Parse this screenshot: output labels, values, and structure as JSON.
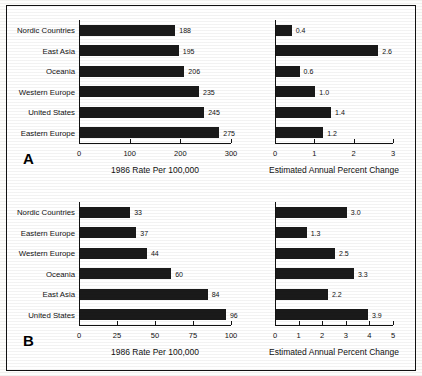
{
  "figure": {
    "panels": [
      {
        "letter": "A",
        "charts": [
          {
            "caption": "1986 Rate Per 100,000",
            "ticks": [
              "0",
              "100",
              "200",
              "300"
            ],
            "tick_values": [
              0,
              100,
              200,
              300
            ],
            "categories": [
              "Nordic Countries",
              "East Asia",
              "Oceania",
              "Western Europe",
              "United States",
              "Eastern Europe"
            ],
            "values": [
              188,
              195,
              206,
              235,
              245,
              275
            ],
            "value_labels": [
              "188",
              "195",
              "206",
              "235",
              "245",
              "275"
            ]
          },
          {
            "caption": "Estimated Annual Percent Change",
            "ticks": [
              "0",
              "1",
              "2",
              "3"
            ],
            "tick_values": [
              0,
              1,
              2,
              3
            ],
            "categories": [
              "Nordic Countries",
              "East Asia",
              "Oceania",
              "Western Europe",
              "United States",
              "Eastern Europe"
            ],
            "values": [
              0.4,
              2.6,
              0.6,
              1.0,
              1.4,
              1.2
            ],
            "value_labels": [
              "0.4",
              "2.6",
              "0.6",
              "1.0",
              "1.4",
              "1.2"
            ]
          }
        ]
      },
      {
        "letter": "B",
        "charts": [
          {
            "caption": "1986 Rate Per 100,000",
            "ticks": [
              "0",
              "25",
              "50",
              "75",
              "100"
            ],
            "tick_values": [
              0,
              25,
              50,
              75,
              100
            ],
            "categories": [
              "Nordic Countries",
              "Eastern Europe",
              "Western Europe",
              "Oceania",
              "East Asia",
              "United States"
            ],
            "values": [
              33,
              37,
              44,
              60,
              84,
              96
            ],
            "value_labels": [
              "33",
              "37",
              "44",
              "60",
              "84",
              "96"
            ]
          },
          {
            "caption": "Estimated Annual Percent Change",
            "ticks": [
              "0",
              "1",
              "2",
              "3",
              "4",
              "5"
            ],
            "tick_values": [
              0,
              1,
              2,
              3,
              4,
              5
            ],
            "categories": [
              "Nordic Countries",
              "Eastern Europe",
              "Western Europe",
              "Oceania",
              "East Asia",
              "United States"
            ],
            "values": [
              3.0,
              1.3,
              2.5,
              3.3,
              2.2,
              3.9
            ],
            "value_labels": [
              "3.0",
              "1.3",
              "2.5",
              "3.3",
              "2.2",
              "3.9"
            ]
          }
        ]
      }
    ]
  },
  "chart_data": [
    {
      "type": "bar",
      "orientation": "horizontal",
      "panel": "A",
      "position": "left",
      "title": "",
      "xlabel": "1986 Rate Per 100,000",
      "ylabel": "",
      "categories": [
        "Nordic Countries",
        "East Asia",
        "Oceania",
        "Western Europe",
        "United States",
        "Eastern Europe"
      ],
      "values": [
        188,
        195,
        206,
        235,
        245,
        275
      ],
      "xlim": [
        0,
        300
      ],
      "xticks": [
        0,
        100,
        200,
        300
      ],
      "grid": false,
      "legend": "none",
      "data_labels": true
    },
    {
      "type": "bar",
      "orientation": "horizontal",
      "panel": "A",
      "position": "right",
      "title": "",
      "xlabel": "Estimated Annual Percent Change",
      "ylabel": "",
      "categories": [
        "Nordic Countries",
        "East Asia",
        "Oceania",
        "Western Europe",
        "United States",
        "Eastern Europe"
      ],
      "values": [
        0.4,
        2.6,
        0.6,
        1.0,
        1.4,
        1.2
      ],
      "xlim": [
        0,
        3
      ],
      "xticks": [
        0,
        1,
        2,
        3
      ],
      "grid": false,
      "legend": "none",
      "data_labels": true
    },
    {
      "type": "bar",
      "orientation": "horizontal",
      "panel": "B",
      "position": "left",
      "title": "",
      "xlabel": "1986 Rate Per 100,000",
      "ylabel": "",
      "categories": [
        "Nordic Countries",
        "Eastern Europe",
        "Western Europe",
        "Oceania",
        "East Asia",
        "United States"
      ],
      "values": [
        33,
        37,
        44,
        60,
        84,
        96
      ],
      "xlim": [
        0,
        100
      ],
      "xticks": [
        0,
        25,
        50,
        75,
        100
      ],
      "grid": false,
      "legend": "none",
      "data_labels": true
    },
    {
      "type": "bar",
      "orientation": "horizontal",
      "panel": "B",
      "position": "right",
      "title": "",
      "xlabel": "Estimated Annual Percent Change",
      "ylabel": "",
      "categories": [
        "Nordic Countries",
        "Eastern Europe",
        "Western Europe",
        "Oceania",
        "East Asia",
        "United States"
      ],
      "values": [
        3.0,
        1.3,
        2.5,
        3.3,
        2.2,
        3.9
      ],
      "xlim": [
        0,
        5
      ],
      "xticks": [
        0,
        1,
        2,
        3,
        4,
        5
      ],
      "grid": false,
      "legend": "none",
      "data_labels": true
    }
  ],
  "colors": {
    "bar": "#1a1a1a",
    "axis": "#111111",
    "background": "#ffffff",
    "border": "#111111"
  }
}
